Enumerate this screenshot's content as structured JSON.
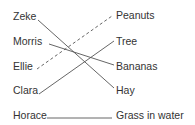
{
  "diagram": {
    "type": "matching",
    "left_items": [
      {
        "label": "Zeke",
        "x": 13,
        "y": 16,
        "anchor_x": 38,
        "anchor_y": 20
      },
      {
        "label": "Morris",
        "x": 13,
        "y": 41,
        "anchor_x": 49,
        "anchor_y": 44
      },
      {
        "label": "Ellie",
        "x": 13,
        "y": 66,
        "anchor_x": 37,
        "anchor_y": 69
      },
      {
        "label": "Clara",
        "x": 13,
        "y": 90,
        "anchor_x": 39,
        "anchor_y": 94
      },
      {
        "label": "Horace",
        "x": 13,
        "y": 115,
        "anchor_x": 47,
        "anchor_y": 118
      }
    ],
    "right_items": [
      {
        "label": "Peanuts",
        "x": 116,
        "y": 11,
        "anchor_x": 112,
        "anchor_y": 16
      },
      {
        "label": "Tree",
        "x": 116,
        "y": 36,
        "anchor_x": 114,
        "anchor_y": 41
      },
      {
        "label": "Bananas",
        "x": 116,
        "y": 61,
        "anchor_x": 114,
        "anchor_y": 65
      },
      {
        "label": "Hay",
        "x": 116,
        "y": 85,
        "anchor_x": 114,
        "anchor_y": 88
      },
      {
        "label": "Grass in water",
        "x": 116,
        "y": 112,
        "anchor_x": 112,
        "anchor_y": 118
      }
    ],
    "connections": [
      {
        "from": "Zeke",
        "to": "Hay",
        "style": "solid"
      },
      {
        "from": "Morris",
        "to": "Bananas",
        "style": "solid"
      },
      {
        "from": "Ellie",
        "to": "Peanuts",
        "style": "dashed"
      },
      {
        "from": "Clara",
        "to": "Tree",
        "style": "solid"
      },
      {
        "from": "Horace",
        "to": "Grass in water",
        "style": "solid"
      }
    ],
    "colors": {
      "text": "#333333",
      "line": "#555555",
      "background": "#ffffff"
    }
  }
}
